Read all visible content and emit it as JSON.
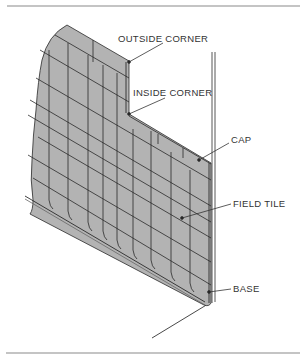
{
  "diagram": {
    "labels": {
      "outside_corner": "OUTSIDE CORNER",
      "inside_corner": "INSIDE CORNER",
      "cap": "CAP",
      "field_tile": "FIELD TILE",
      "base": "BASE"
    },
    "colors": {
      "tile_fill": "#b3b3b3",
      "grout_line": "#2a2a2a",
      "rule": "#8a8a8a",
      "text": "#333333"
    }
  }
}
